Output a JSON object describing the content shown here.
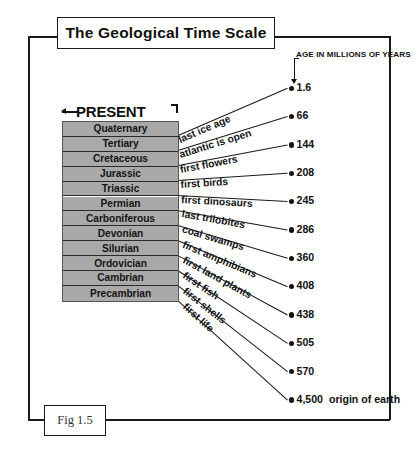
{
  "title": "The Geological Time Scale",
  "figure_caption": "Fig 1.5",
  "present_label": "PRESENT",
  "axis_header": "AGE IN MILLIONS OF YEARS",
  "origin_note": "origin of earth",
  "colors": {
    "row_fill": "#a9a9a9",
    "line": "#1a1a1a",
    "text": "#111111"
  },
  "periods": [
    {
      "name": "Quaternary"
    },
    {
      "name": "Tertiary"
    },
    {
      "name": "Cretaceous"
    },
    {
      "name": "Jurassic"
    },
    {
      "name": "Triassic"
    },
    {
      "name": "Permian"
    },
    {
      "name": "Carboniferous"
    },
    {
      "name": "Devonian"
    },
    {
      "name": "Silurian"
    },
    {
      "name": "Ordovician"
    },
    {
      "name": "Cambrian"
    },
    {
      "name": "Precambrian"
    }
  ],
  "events": [
    {
      "label": "last ice age",
      "age": "1.6"
    },
    {
      "label": "atlantic is open",
      "age": "66"
    },
    {
      "label": "first flowers",
      "age": "144"
    },
    {
      "label": "first birds",
      "age": "208"
    },
    {
      "label": "first dinosaurs",
      "age": "245"
    },
    {
      "label": "last trilobites",
      "age": "286"
    },
    {
      "label": "coal swamps",
      "age": "360"
    },
    {
      "label": "first amphibians",
      "age": "408"
    },
    {
      "label": "first land plants",
      "age": "438"
    },
    {
      "label": "first fish",
      "age": "505"
    },
    {
      "label": "first shells",
      "age": "570"
    },
    {
      "label": "first life",
      "age": "4,500"
    }
  ]
}
